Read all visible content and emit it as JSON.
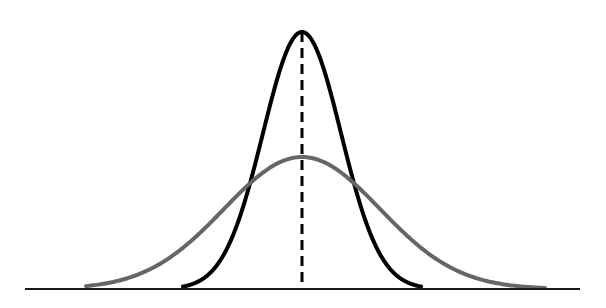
{
  "figure": {
    "background_color": "#ffffff",
    "width": 606,
    "height": 308,
    "title": "",
    "has_text_labels": false
  },
  "chart_data": {
    "type": "line",
    "title": "",
    "subtitle": "",
    "xlabel": "",
    "ylabel": "",
    "xlim": [
      0,
      606
    ],
    "ylim": [
      0,
      1
    ],
    "grid": false,
    "legend": false,
    "legend_position": "none",
    "x_tick_labels": [],
    "y_tick_labels": [],
    "annotations": [
      {
        "name": "mean-line",
        "kind": "vertical-dashed-line",
        "x": 302,
        "y_top": 32,
        "y_bottom": 289,
        "color": "#000000",
        "stroke_width": 3,
        "dash_length": 10,
        "gap_length": 6,
        "label": ""
      }
    ],
    "series": [
      {
        "name": "narrow-distribution",
        "description": "tall narrow normal curve, small standard deviation",
        "color": "#000000",
        "stroke_width": 4,
        "style": "solid",
        "distribution": "normal",
        "mean": 302,
        "sigma": 39,
        "peak_x": 302,
        "peak_y": 32,
        "peak_height": 257,
        "baseline_y": 289,
        "left_tail_x": 183,
        "right_tail_x": 421,
        "x": [
          183,
          199,
          215,
          231,
          243,
          255,
          263,
          271,
          279,
          287,
          294,
          302,
          310,
          317,
          325,
          333,
          341,
          349,
          361,
          373,
          389,
          405,
          421
        ],
        "y": [
          289,
          288,
          284,
          269,
          250,
          219,
          194,
          164,
          129,
          95,
          60,
          32,
          60,
          95,
          129,
          164,
          194,
          219,
          250,
          269,
          284,
          288,
          289
        ]
      },
      {
        "name": "wide-distribution",
        "description": "short wide normal curve, large standard deviation",
        "color": "#666666",
        "stroke_width": 4,
        "style": "solid",
        "distribution": "normal",
        "mean": 302,
        "sigma": 78,
        "peak_x": 302,
        "peak_y": 157,
        "peak_height": 132,
        "baseline_y": 289,
        "left_tail_x": 86,
        "right_tail_x": 545,
        "x": [
          86,
          110,
          134,
          158,
          182,
          206,
          226,
          246,
          262,
          278,
          290,
          302,
          314,
          326,
          342,
          358,
          378,
          398,
          422,
          446,
          470,
          494,
          518,
          545
        ],
        "y": [
          289,
          288,
          285,
          279,
          270,
          256,
          241,
          223,
          206,
          186,
          171,
          157,
          171,
          186,
          206,
          223,
          241,
          256,
          270,
          279,
          285,
          288,
          289,
          289
        ]
      }
    ],
    "axes": [
      {
        "name": "baseline",
        "orientation": "horizontal",
        "y": 289,
        "x_start": 25,
        "x_end": 580,
        "color": "#1a1a1a",
        "stroke_width": 2
      }
    ]
  }
}
